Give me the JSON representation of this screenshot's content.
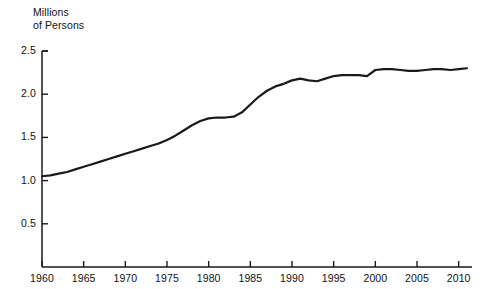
{
  "chart_data": {
    "type": "line",
    "title": "",
    "subtitle": "",
    "xlabel": "",
    "ylabel": "Millions\nof Persons",
    "ylabel_lines": [
      "Millions",
      "of Persons"
    ],
    "xlim": [
      1960,
      2011.5
    ],
    "ylim": [
      0,
      2.5
    ],
    "grid": false,
    "legend": null,
    "yticks": [
      0.5,
      1.0,
      1.5,
      2.0,
      2.5
    ],
    "ytick_labels": [
      "0.5",
      "1.0",
      "1.5",
      "2.0",
      "2.5"
    ],
    "xticks": [
      1960,
      1965,
      1970,
      1975,
      1980,
      1985,
      1990,
      1995,
      2000,
      2005,
      2010
    ],
    "xtick_labels": [
      "1960",
      "1965",
      "1970",
      "1975",
      "1980",
      "1985",
      "1990",
      "1995",
      "2000",
      "2005",
      "2010"
    ],
    "line_color": "#1a1a1a",
    "line_width": 2.2,
    "axis_color": "#1a1a1a",
    "background_color": "#ffffff",
    "x": [
      1960,
      1961,
      1962,
      1963,
      1964,
      1965,
      1966,
      1967,
      1968,
      1969,
      1970,
      1971,
      1972,
      1973,
      1974,
      1975,
      1976,
      1977,
      1978,
      1979,
      1980,
      1981,
      1982,
      1983,
      1984,
      1985,
      1986,
      1987,
      1988,
      1989,
      1990,
      1991,
      1992,
      1993,
      1994,
      1995,
      1996,
      1997,
      1998,
      1999,
      2000,
      2001,
      2002,
      2003,
      2004,
      2005,
      2006,
      2007,
      2008,
      2009,
      2010,
      2011
    ],
    "values": [
      1.05,
      1.06,
      1.08,
      1.1,
      1.13,
      1.16,
      1.19,
      1.22,
      1.25,
      1.28,
      1.31,
      1.34,
      1.37,
      1.4,
      1.43,
      1.47,
      1.52,
      1.58,
      1.64,
      1.69,
      1.72,
      1.73,
      1.73,
      1.74,
      1.79,
      1.88,
      1.97,
      2.04,
      2.09,
      2.12,
      2.16,
      2.18,
      2.16,
      2.15,
      2.18,
      2.21,
      2.22,
      2.22,
      2.22,
      2.21,
      2.28,
      2.29,
      2.29,
      2.28,
      2.27,
      2.27,
      2.28,
      2.29,
      2.29,
      2.28,
      2.29,
      2.3
    ],
    "series": [
      {
        "name": "Millions of Persons",
        "values": [
          1.05,
          1.06,
          1.08,
          1.1,
          1.13,
          1.16,
          1.19,
          1.22,
          1.25,
          1.28,
          1.31,
          1.34,
          1.37,
          1.4,
          1.43,
          1.47,
          1.52,
          1.58,
          1.64,
          1.69,
          1.72,
          1.73,
          1.73,
          1.74,
          1.79,
          1.88,
          1.97,
          2.04,
          2.09,
          2.12,
          2.16,
          2.18,
          2.16,
          2.15,
          2.18,
          2.21,
          2.22,
          2.22,
          2.22,
          2.21,
          2.28,
          2.29,
          2.29,
          2.28,
          2.27,
          2.27,
          2.28,
          2.29,
          2.29,
          2.28,
          2.29,
          2.3
        ]
      }
    ]
  },
  "geometry": {
    "plot_left": 42,
    "plot_right": 472,
    "plot_top": 51,
    "plot_bottom": 267,
    "y_value_top": 2.5,
    "y_value_bottom": 0.0,
    "x_value_left": 1960,
    "x_value_right": 2011.6
  }
}
